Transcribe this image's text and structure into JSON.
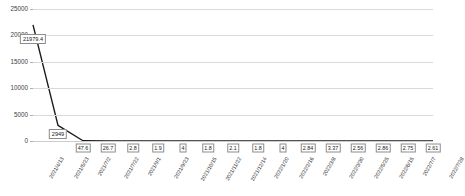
{
  "chart_data": {
    "type": "line",
    "title": "",
    "xlabel": "",
    "ylabel": "",
    "ylim": [
      0,
      25000
    ],
    "yticks": [
      0,
      5000,
      10000,
      15000,
      20000,
      25000
    ],
    "ytick_labels": [
      "0",
      "5000",
      "10000",
      "15000",
      "20000",
      "25000"
    ],
    "grid": true,
    "legend": "none",
    "categories": [
      "2021/4/13",
      "2021/5/23",
      "2021/7/2",
      "2021/7/22",
      "2021/9/1",
      "2021/9/23",
      "2021/10/15",
      "2021/11/22",
      "2021/12/14",
      "2022/1/20",
      "2022/2/16",
      "2022/3/8",
      "2022/3/30",
      "2022/5/25",
      "2022/6/15",
      "2022/7/7",
      "2022/7/28"
    ],
    "values": [
      21979.4,
      2949,
      47.6,
      26.7,
      2.8,
      1.9,
      4,
      1.8,
      2.1,
      1.8,
      4,
      2.84,
      3.37,
      2.56,
      2.86,
      2.75,
      2.61
    ],
    "point_labels": [
      "21979.4",
      "2949",
      "47.6",
      "26.7",
      "2.8",
      "1.9",
      "4",
      "1.8",
      "2.1",
      "1.8",
      "4",
      "2.84",
      "3.37",
      "2.56",
      "2.86",
      "2.75",
      "2.61"
    ],
    "series_color": "#1a1a1a",
    "grid_color": "#d9d9d9",
    "label_box_border": "#8c8c8c"
  }
}
